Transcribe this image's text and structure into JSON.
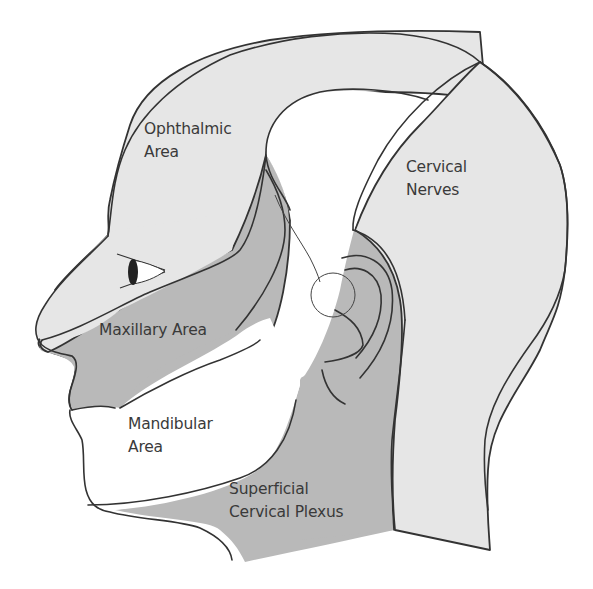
{
  "figure": {
    "colors": {
      "light_region": "#e6e6e6",
      "dark_region": "#b9b9b9",
      "white_region": "#ffffff",
      "outline": "#333333",
      "label_text": "#3a3a3a"
    }
  },
  "labels": {
    "ophthalmic": {
      "line1": "Ophthalmic",
      "line2": "Area"
    },
    "cervical_nerves": {
      "line1": "Cervical",
      "line2": "Nerves"
    },
    "maxillary": {
      "line1": "Maxillary Area"
    },
    "mandibular": {
      "line1": "Mandibular",
      "line2": "Area"
    },
    "superficial_cervical_plexus": {
      "line1": "Superficial",
      "line2": "Cervical Plexus"
    }
  }
}
